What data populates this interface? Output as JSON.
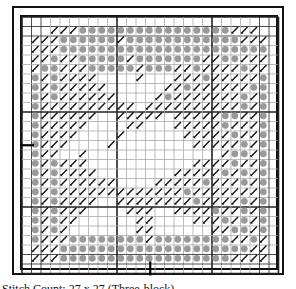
{
  "chart_caption": "Stitch Count: 27 x 27 (Three-block)",
  "grid": {
    "cells": 27,
    "origin_x": 22,
    "origin_y": 17,
    "step": 9.5,
    "thick_every": 10,
    "line_color": "#222222",
    "light_line_color": "#aaaaaa",
    "dot_color": "#999999",
    "stitch_color": "#111111"
  },
  "markers": {
    "left_center_row": 13,
    "bottom_center_col": 13
  },
  "pattern": [
    "../ / / oooooooooooooooo/ / / ..",
    "///oooooo/oooooooooooo///",
    "///oooooooooooooooooooooo",
    "//o//ooooo/ooooooo//oo///",
    "/oo///ooooo/ooo//o////o//",
    "o/o////..../...///o/////o",
    "o/o/////......//o//////oo",
    "o/o//////..../o///////o/o",
    "o//////////.//////////o/o",
    "o//////../////./////oo//o",
    "o/////....//.../////o///o",
    "o////..../....../////o//o",
    "o///..../......../////o/o",
    "o//../............../oo/o",
    "o/o///...........////o//o",
    "o/o////......../////o/o/o",
    "o/o//////..../////o///o/o",
    "o/o/////////////o///////o",
    "o/o////..////////o////o/o",
    "o/o///....///..////o//o/o",
    "o/o//......//....///o/o/o",
    "o/o/.......//......//oo/o",
    "o///oooooooo/oooooooo//o/",
    "///oooooooooooooooooooo//",
    "///oooooooooooooooooo////"
  ]
}
